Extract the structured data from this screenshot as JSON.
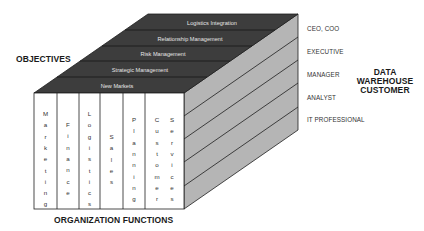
{
  "diagram": {
    "type": "3d-cube-framework",
    "axes": {
      "top_label": "OBJECTIVES",
      "front_label": "ORGANIZATION FUNCTIONS",
      "side_label_lines": [
        "DATA",
        "WAREHOUSE",
        "CUSTOMER"
      ]
    },
    "objectives": [
      "New Markets",
      "Strategic Management",
      "Risk Management",
      "Relationship Management",
      "Logistics Integration"
    ],
    "functions": [
      "Marketing",
      "Finance",
      "Logistics",
      "Sales",
      "Planning",
      "Customer",
      "Services"
    ],
    "customer_levels": [
      "CEO, COO",
      "EXECUTIVE",
      "MANAGER",
      "ANALYST",
      "IT PROFESSIONAL"
    ],
    "colors": {
      "top_face": "#3d3d3d",
      "side_face": "#b5b5b5",
      "front_face": "#ffffff",
      "lines": "#1e1e1e",
      "top_text": "#e6e6e6"
    }
  }
}
